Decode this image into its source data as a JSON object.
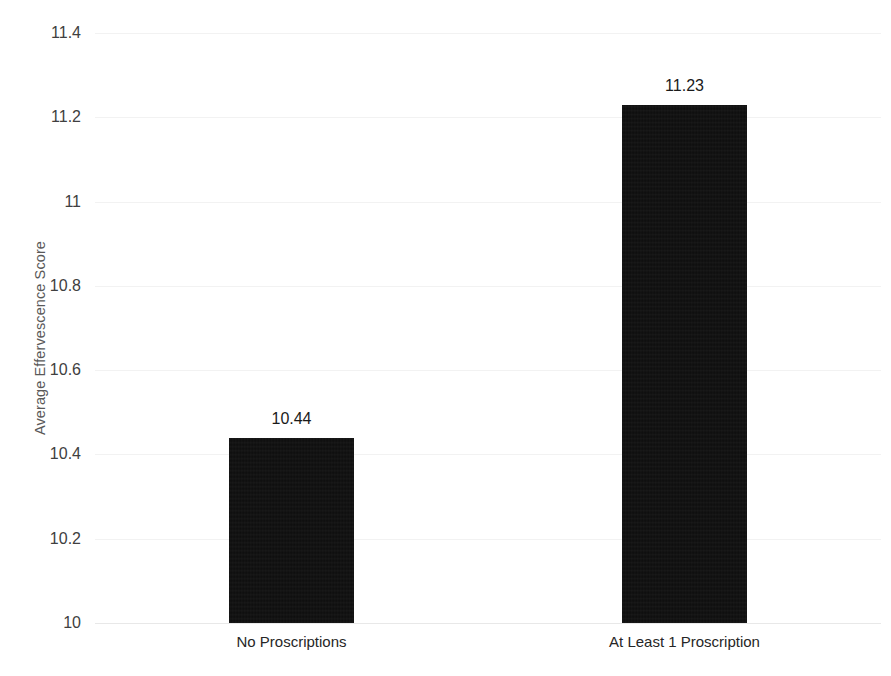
{
  "chart_data": {
    "type": "bar",
    "title": "",
    "subtitle": "",
    "xlabel": "",
    "ylabel": "Average Effervescence Score",
    "categories": [
      "No Proscriptions",
      "At Least 1 Proscription"
    ],
    "values": [
      10.44,
      11.23
    ],
    "value_labels": [
      "10.44",
      "11.23"
    ],
    "ylim": [
      10,
      11.4
    ],
    "ytick_step": 0.2,
    "ytick_labels": [
      "11.4",
      "11.2",
      "11",
      "10.8",
      "10.6",
      "10.4",
      "10.2",
      "10"
    ],
    "ytick_values": [
      11.4,
      11.2,
      11,
      10.8,
      10.6,
      10.4,
      10.2,
      10
    ],
    "grid": true,
    "grid_axis": "y",
    "legend": false,
    "legend_position": "none",
    "series": [
      {
        "name": "Average Effervescence Score",
        "values": [
          10.44,
          11.23
        ]
      }
    ],
    "colors": {
      "bar_fill": "#0d0d0d",
      "gridline": "#f2f2f2",
      "baseline": "#e8e8e8",
      "tick_text": "#404040",
      "axis_title_text": "#595959",
      "value_label_text": "#1a1a1a",
      "category_label_text": "#262626",
      "background": "#ffffff"
    }
  }
}
